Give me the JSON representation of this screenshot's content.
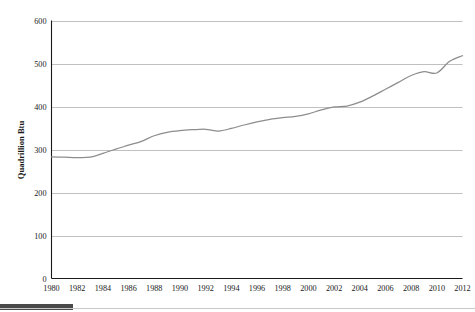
{
  "chart_data": {
    "type": "line",
    "title": "",
    "subtitle": "",
    "xlabel": "",
    "ylabel": "Quadrillion Btu",
    "xlim": [
      1980,
      2012
    ],
    "ylim": [
      0,
      600
    ],
    "grid": true,
    "grid_orientation": "horizontal",
    "legend": false,
    "legend_position": "none",
    "line_color": "#8d8d8d",
    "gridline_color": "#b9b9b9",
    "axis_color": "#1a1a1a",
    "background_color": "#ffffff",
    "y_ticks": [
      0,
      100,
      200,
      300,
      400,
      500,
      600
    ],
    "y_tick_labels": [
      "0",
      "100",
      "200",
      "300",
      "400",
      "500",
      "600"
    ],
    "x_ticks": [
      1980,
      1982,
      1984,
      1986,
      1988,
      1990,
      1992,
      1994,
      1996,
      1998,
      2000,
      2002,
      2004,
      2006,
      2008,
      2010,
      2012
    ],
    "x_tick_labels": [
      "1980",
      "1982",
      "1984",
      "1986",
      "1988",
      "1990",
      "1992",
      "1994",
      "1996",
      "1998",
      "2000",
      "2002",
      "2004",
      "2006",
      "2008",
      "2010",
      "2012"
    ],
    "x": [
      1980,
      1981,
      1982,
      1983,
      1984,
      1985,
      1986,
      1987,
      1988,
      1989,
      1990,
      1991,
      1992,
      1993,
      1994,
      1995,
      1996,
      1997,
      1998,
      1999,
      2000,
      2001,
      2002,
      2003,
      2004,
      2005,
      2006,
      2007,
      2008,
      2009,
      2010,
      2011,
      2012
    ],
    "values": [
      283,
      282,
      281,
      282,
      291,
      301,
      310,
      319,
      332,
      340,
      344,
      346,
      347,
      343,
      349,
      357,
      364,
      370,
      374,
      377,
      383,
      392,
      399,
      401,
      410,
      424,
      440,
      456,
      472,
      481,
      478,
      505,
      518
    ],
    "series": [
      {
        "name": "Total energy consumption",
        "values": [
          283,
          282,
          281,
          282,
          291,
          301,
          310,
          319,
          332,
          340,
          344,
          346,
          347,
          343,
          349,
          357,
          364,
          370,
          374,
          377,
          383,
          392,
          399,
          401,
          410,
          424,
          440,
          456,
          472,
          481,
          478,
          505,
          518
        ]
      }
    ]
  },
  "footer": {
    "bar_color": "#4a4a4a",
    "rule_color": "#c9c9c9"
  }
}
